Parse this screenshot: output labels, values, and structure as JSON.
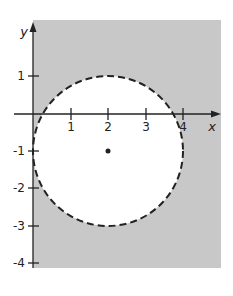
{
  "figure": {
    "x_axis_label": "x",
    "y_axis_label": "y",
    "x_ticks": [
      "1",
      "2",
      "3",
      "4"
    ],
    "y_ticks": [
      "1",
      "-1",
      "-2",
      "-3",
      "-4"
    ],
    "circle": {
      "center_x": 2,
      "center_y": -1,
      "radius": 2,
      "style": "dashed"
    },
    "shaded_region": "outside circle",
    "colors": {
      "shade": "#c8c8c8",
      "inside": "#ffffff",
      "ink": "#222222"
    }
  }
}
